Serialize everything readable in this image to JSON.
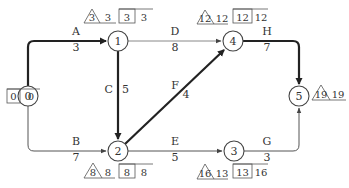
{
  "diagram": {
    "type": "activity-on-arrow network (arrow diagram)",
    "nodes": [
      {
        "id": "0",
        "label": "0",
        "x": 28,
        "y": 96
      },
      {
        "id": "1",
        "label": "1",
        "x": 118,
        "y": 41
      },
      {
        "id": "2",
        "label": "2",
        "x": 118,
        "y": 151
      },
      {
        "id": "3",
        "label": "3",
        "x": 234,
        "y": 151
      },
      {
        "id": "4",
        "label": "4",
        "x": 233,
        "y": 41
      },
      {
        "id": "5",
        "label": "5",
        "x": 299,
        "y": 96
      }
    ],
    "activities": [
      {
        "name": "A",
        "duration": "3",
        "from": "0",
        "to": "1",
        "critical": true
      },
      {
        "name": "B",
        "duration": "7",
        "from": "0",
        "to": "2",
        "critical": false
      },
      {
        "name": "C",
        "duration": "5",
        "from": "1",
        "to": "2",
        "critical": true
      },
      {
        "name": "D",
        "duration": "8",
        "from": "1",
        "to": "4",
        "critical": false
      },
      {
        "name": "E",
        "duration": "5",
        "from": "2",
        "to": "3",
        "critical": false
      },
      {
        "name": "F",
        "duration": "4",
        "from": "2",
        "to": "4",
        "critical": true
      },
      {
        "name": "G",
        "duration": "3",
        "from": "3",
        "to": "5",
        "critical": false
      },
      {
        "name": "H",
        "duration": "7",
        "from": "4",
        "to": "5",
        "critical": true
      }
    ],
    "node_annotations": {
      "0": {
        "box1": "0",
        "box2": "0"
      },
      "1": {
        "triangle": "3",
        "plain": "3",
        "box1": "3",
        "box2": "3"
      },
      "2": {
        "triangle": "8",
        "plain": "8",
        "box1": "8",
        "box2": "8"
      },
      "3": {
        "triangle": "16",
        "plain": "13",
        "box1": "13",
        "box2": "16"
      },
      "4": {
        "triangle": "12",
        "plain": "12",
        "box1": "12",
        "box2": "12"
      },
      "5": {
        "triangle": "19",
        "plain": "19"
      }
    },
    "colors": {
      "line": "#444444",
      "critical": "#222222",
      "text": "#333333",
      "thin": "#777777"
    }
  }
}
